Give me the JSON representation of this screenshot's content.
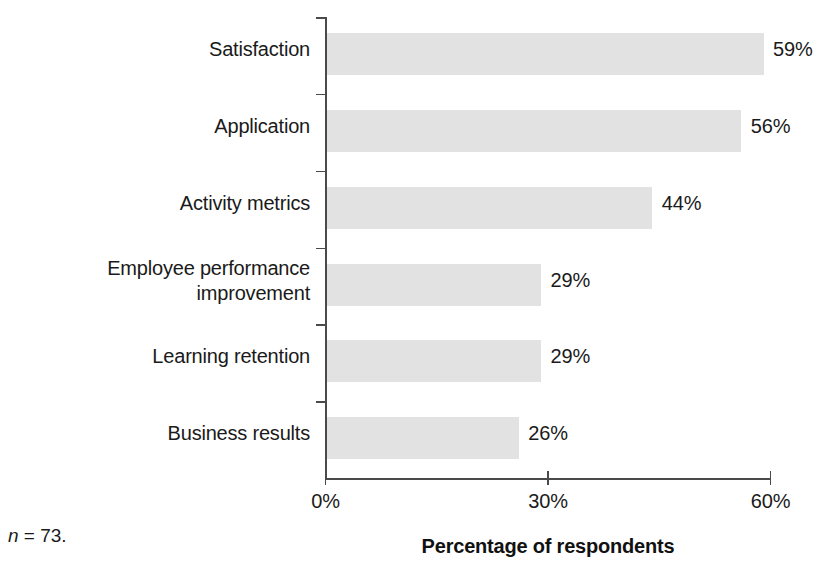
{
  "chart_data": {
    "type": "bar",
    "orientation": "horizontal",
    "title": "",
    "subtitle": "",
    "xlabel": "Percentage of respondents",
    "ylabel": "",
    "categories": [
      "Satisfaction",
      "Application",
      "Activity metrics",
      "Employee performance improvement",
      "Learning retention",
      "Business results"
    ],
    "values": [
      59,
      56,
      44,
      29,
      29,
      26
    ],
    "value_labels": [
      "59%",
      "56%",
      "44%",
      "29%",
      "29%",
      "26%"
    ],
    "xlim": [
      0,
      60
    ],
    "xticks": [
      0,
      30,
      60
    ],
    "xtick_labels": [
      "0%",
      "30%",
      "60%"
    ],
    "grid": false,
    "legend": false,
    "bar_color": "#e2e2e2",
    "axis_color": "#4a4a4a",
    "text_color": "#1a1a1a"
  },
  "category_label_lines": [
    [
      "Satisfaction"
    ],
    [
      "Application"
    ],
    [
      "Activity metrics"
    ],
    [
      "Employee performance",
      "improvement"
    ],
    [
      "Learning retention"
    ],
    [
      "Business results"
    ]
  ],
  "footnote": {
    "symbol": "n",
    "rest": " = 73."
  }
}
